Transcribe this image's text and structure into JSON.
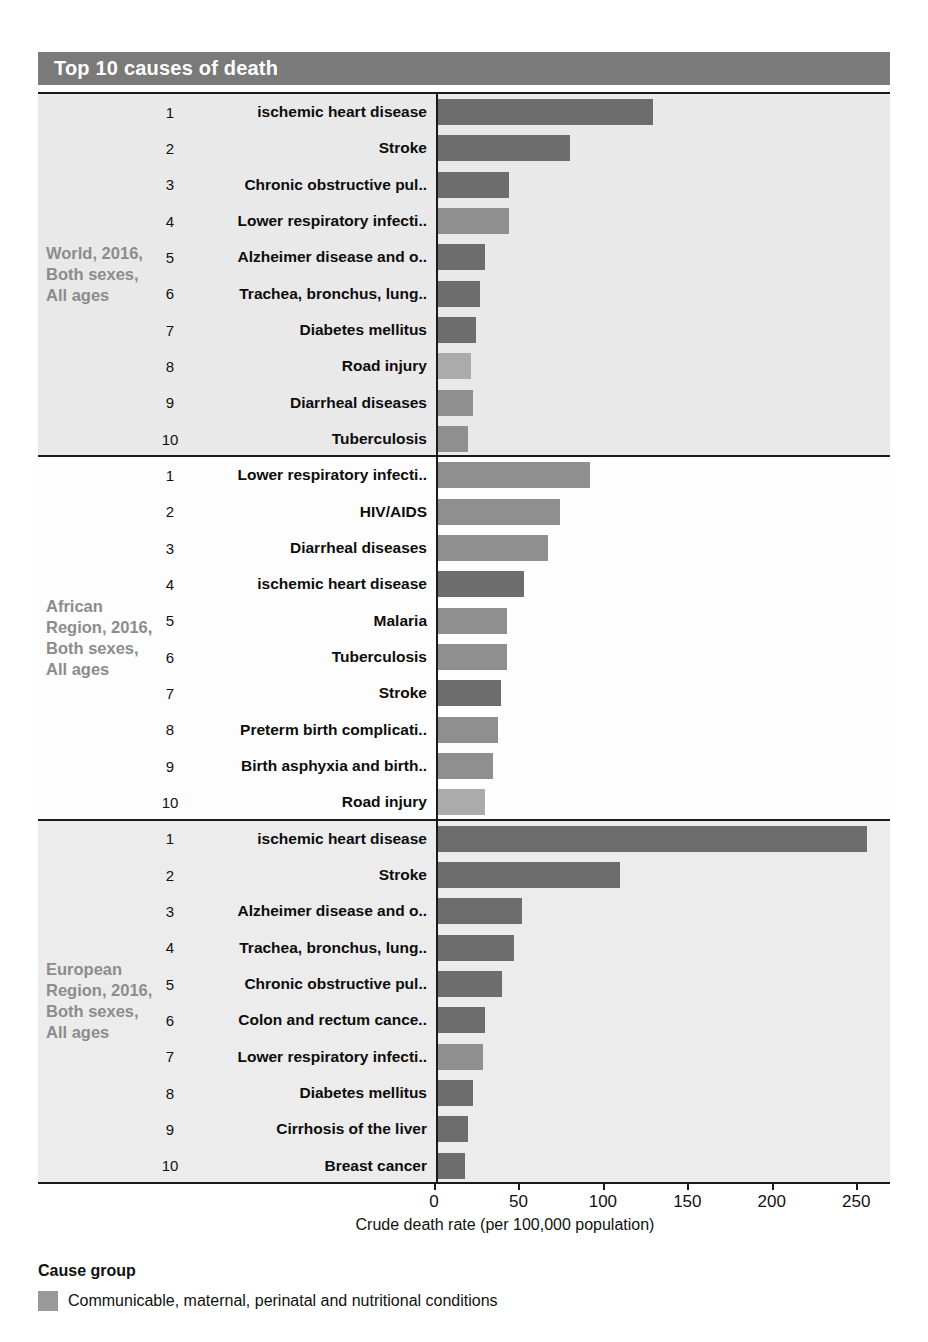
{
  "header": {
    "title": "Top 10 causes of death"
  },
  "axis": {
    "title": "Crude death rate (per 100,000 population)",
    "ticks": [
      0,
      50,
      100,
      150,
      200,
      250
    ],
    "min": 0,
    "max": 270
  },
  "legend": {
    "title": "Cause group",
    "items": [
      {
        "label": "Communicable, maternal, perinatal and nutritional conditions",
        "color": "#9a9a9a"
      }
    ]
  },
  "colors": {
    "communicable": "#8f8f8f",
    "noncommunicable": "#6d6d6d",
    "injuries": "#ababab",
    "header_bar": "#7a7a7a",
    "region_label": "#8c8c8c"
  },
  "chart_data": {
    "type": "bar",
    "title": "Top 10 causes of death",
    "xlabel": "Crude death rate (per 100,000 population)",
    "ylabel": "",
    "xlim": [
      0,
      270
    ],
    "grid": false,
    "orientation": "horizontal",
    "legend_position": "bottom-left",
    "panels": [
      {
        "label": "World, 2016, Both sexes, All ages",
        "categories": [
          "ischemic heart disease",
          "Stroke",
          "Chronic obstructive pul..",
          "Lower respiratory infecti..",
          "Alzheimer disease and o..",
          "Trachea, bronchus, lung..",
          "Diabetes mellitus",
          "Road injury",
          "Diarrheal diseases",
          "Tuberculosis"
        ],
        "ranks": [
          1,
          2,
          3,
          4,
          5,
          6,
          7,
          8,
          9,
          10
        ],
        "values": [
          127.5,
          78,
          42,
          42,
          28,
          25,
          22.5,
          19.5,
          21,
          17.5
        ],
        "groups": [
          "noncommunicable",
          "noncommunicable",
          "noncommunicable",
          "communicable",
          "noncommunicable",
          "noncommunicable",
          "noncommunicable",
          "injuries",
          "communicable",
          "communicable"
        ]
      },
      {
        "label": "African Region, 2016, Both sexes, All ages",
        "categories": [
          "Lower respiratory infecti..",
          "HIV/AIDS",
          "Diarrheal diseases",
          "ischemic heart disease",
          "Malaria",
          "Tuberculosis",
          "Stroke",
          "Preterm birth complicati..",
          "Birth asphyxia and birth..",
          "Road injury"
        ],
        "ranks": [
          1,
          2,
          3,
          4,
          5,
          6,
          7,
          8,
          9,
          10
        ],
        "values": [
          90,
          72.5,
          65,
          51,
          41,
          41,
          37.5,
          35.5,
          32.5,
          28
        ],
        "groups": [
          "communicable",
          "communicable",
          "communicable",
          "noncommunicable",
          "communicable",
          "communicable",
          "noncommunicable",
          "communicable",
          "communicable",
          "injuries"
        ]
      },
      {
        "label": "European Region, 2016, Both sexes, All ages",
        "categories": [
          "ischemic heart disease",
          "Stroke",
          "Alzheimer disease and o..",
          "Trachea, bronchus, lung..",
          "Chronic obstructive pul..",
          "Colon and rectum cance..",
          "Lower respiratory infecti..",
          "Diabetes mellitus",
          "Cirrhosis of the liver",
          "Breast cancer"
        ],
        "ranks": [
          1,
          2,
          3,
          4,
          5,
          6,
          7,
          8,
          9,
          10
        ],
        "values": [
          254,
          108,
          50,
          45,
          38,
          28,
          26.5,
          20.5,
          17.5,
          16
        ],
        "groups": [
          "noncommunicable",
          "noncommunicable",
          "noncommunicable",
          "noncommunicable",
          "noncommunicable",
          "noncommunicable",
          "communicable",
          "noncommunicable",
          "noncommunicable",
          "noncommunicable"
        ]
      }
    ]
  }
}
